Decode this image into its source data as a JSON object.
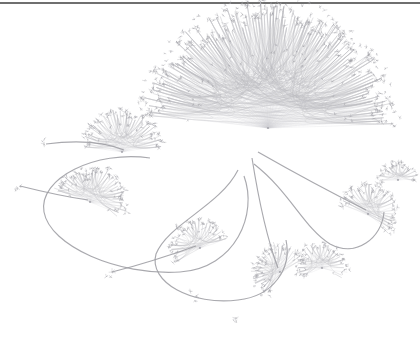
{
  "canvas": {
    "width": 420,
    "height": 338,
    "background_color": "#ffffff",
    "title": "",
    "rendering": "hierarchical edge bundling network graph",
    "top_rule_color": "#6f6f6f"
  },
  "palette": {
    "background": "#ffffff",
    "bundle_edge": "#b9b9bd",
    "trunk_edge": "#9a9aa0",
    "branch_edge": "#b4b4b9",
    "spoke_edge": "#cfcfd4",
    "leaf_node": "#9d9da3",
    "hub_node": "#8e8e95"
  },
  "chart_data": {
    "type": "scatter",
    "title": "",
    "xlabel": "",
    "ylabel": "",
    "grid": false,
    "legend": null,
    "hubs": [
      {
        "id": "hub-main-fan",
        "label": "main radial fan",
        "x": 268,
        "y": 128,
        "radius": 118,
        "spokes": 112,
        "arc_start_deg": 186,
        "arc_end_deg": 358
      },
      {
        "id": "hub-upper-left",
        "label": "upper left burst",
        "x": 122,
        "y": 152,
        "radius": 40,
        "spokes": 34,
        "arc_start_deg": 188,
        "arc_end_deg": 352
      },
      {
        "id": "hub-left-lobe",
        "label": "left lobe hub",
        "x": 90,
        "y": 202,
        "radius": 34,
        "spokes": 30,
        "arc_start_deg": 200,
        "arc_end_deg": 20
      },
      {
        "id": "hub-lower-center",
        "label": "lower center cluster",
        "x": 200,
        "y": 248,
        "radius": 28,
        "spokes": 22,
        "arc_start_deg": 150,
        "arc_end_deg": 340
      },
      {
        "id": "hub-lower-right-a",
        "label": "lower right cluster A",
        "x": 280,
        "y": 272,
        "radius": 26,
        "spokes": 24,
        "arc_start_deg": 120,
        "arc_end_deg": 330
      },
      {
        "id": "hub-lower-right-b",
        "label": "lower right cluster B",
        "x": 322,
        "y": 268,
        "radius": 24,
        "spokes": 22,
        "arc_start_deg": 160,
        "arc_end_deg": 20
      },
      {
        "id": "hub-right-spiral",
        "label": "right spiral cluster",
        "x": 368,
        "y": 214,
        "radius": 28,
        "spokes": 26,
        "arc_start_deg": 200,
        "arc_end_deg": 40
      },
      {
        "id": "hub-far-right",
        "label": "far right small burst",
        "x": 398,
        "y": 180,
        "radius": 18,
        "spokes": 14,
        "arc_start_deg": 180,
        "arc_end_deg": 360
      }
    ],
    "trunk_loops": [
      {
        "id": "loop-left",
        "label": "left lobe loop",
        "path": "M 150,158 C 96,150 38,178 44,212 C 50,246 118,276 180,272 C 236,268 258,214 244,176"
      },
      {
        "id": "loop-lower",
        "label": "lower center loop",
        "path": "M 238,170 C 220,206 168,224 156,254 C 148,282 192,306 238,300 C 274,296 292,268 286,240"
      },
      {
        "id": "loop-right",
        "label": "right lobe loop",
        "path": "M 254,164 C 290,192 304,228 330,244 C 356,258 382,238 384,212"
      }
    ],
    "long_links": [
      {
        "id": "link-far-left",
        "from": "hub-left-lobe",
        "to": "node-far-left",
        "path": "M 88,200 C 60,196 36,190 20,186"
      },
      {
        "id": "link-ne-tail",
        "from": "hub-upper-left",
        "to": "node-ne-tail",
        "path": "M 124,150 C 104,142 76,140 46,144"
      },
      {
        "id": "link-sw-tail",
        "from": "hub-lower-center",
        "to": "node-sw-tail",
        "path": "M 196,246 C 168,256 136,266 112,272"
      },
      {
        "id": "link-cross",
        "from": "hub-main-fan",
        "to": "hub-right-spiral",
        "path": "M 258,152 C 300,176 338,196 366,210"
      },
      {
        "id": "link-diag",
        "from": "hub-main-fan",
        "to": "hub-lower-right-a",
        "path": "M 252,158 C 258,196 266,236 278,268"
      }
    ],
    "isolated_nodes": [
      {
        "id": "node-far-left",
        "x": 20,
        "y": 186
      },
      {
        "id": "node-ne-tail",
        "x": 44,
        "y": 144
      },
      {
        "id": "node-sw-tail",
        "x": 112,
        "y": 272
      },
      {
        "id": "node-mid-low",
        "x": 196,
        "y": 296
      },
      {
        "id": "node-drift-a",
        "x": 346,
        "y": 192
      },
      {
        "id": "node-drift-b",
        "x": 236,
        "y": 318
      }
    ],
    "counts": {
      "hub_count": 8,
      "approx_leaf_nodes": 284,
      "approx_edges": 340
    }
  }
}
